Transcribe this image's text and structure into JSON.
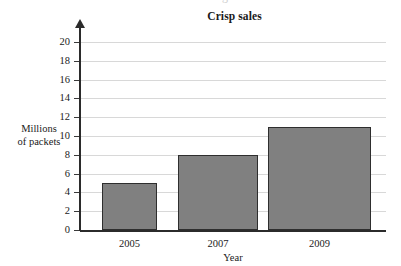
{
  "figure": {
    "title": "Crisp sales",
    "ghost_text": "cut-off line of text above figure",
    "background": "#ffffff",
    "bar_fill": "#808080",
    "bar_border": "#2e2e2e",
    "grid_color": "#d8d8d8",
    "axis_color": "#2b2b2b"
  },
  "chart_data": {
    "type": "bar",
    "title": "Crisp sales",
    "categories": [
      "2005",
      "2007",
      "2009"
    ],
    "values": [
      5,
      8,
      11
    ],
    "xlabel": "Year",
    "ylabel": "Millions of packets",
    "ylabel_lines": [
      "Millions",
      "of packets"
    ],
    "ylim": [
      0,
      20
    ],
    "ytick_step": 2,
    "yticks": [
      0,
      2,
      4,
      6,
      8,
      10,
      12,
      14,
      16,
      18,
      20
    ],
    "ytick_labels": [
      "0",
      "2",
      "4",
      "6",
      "8",
      "10",
      "12",
      "14",
      "16",
      "18",
      "20"
    ],
    "grid": "horizontal",
    "legend": null,
    "series": [
      {
        "name": "Millions of packets",
        "values": [
          5,
          8,
          11
        ]
      }
    ]
  }
}
